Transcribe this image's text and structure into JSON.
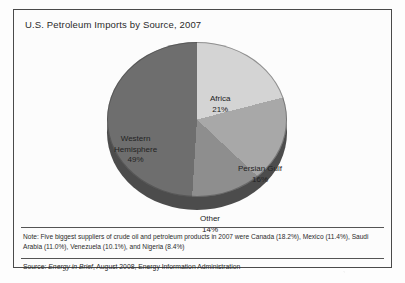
{
  "figure": {
    "title": "U.S. Petroleum Imports by Source, 2007",
    "note": "Note: Five biggest suppliers of crude oil and petroleum products in 2007 were Canada (18.2%), Mexico (11.4%), Saudi Arabia (11.0%), Venezuela (10.1%), and Nigeria (8.4%)",
    "source_prefix": "Source: ",
    "source_publication": "Energy in Brief",
    "source_suffix": ", August 2008, Energy Information Administration"
  },
  "chart_data": {
    "type": "pie",
    "title": "U.S. Petroleum Imports by Source, 2007",
    "xlabel": "",
    "ylabel": "",
    "legend": "none",
    "grid": false,
    "start_angle_deg": 0,
    "direction": "clockwise",
    "categories": [
      "Africa",
      "Persian Gulf",
      "Other",
      "Western Hemisphere"
    ],
    "values": [
      21,
      16,
      14,
      49
    ],
    "unit": "%",
    "colors": [
      "#d4d4d4",
      "#a8a8a8",
      "#8e8e8e",
      "#6e6e6e"
    ],
    "depth_color": "#4c4c4c",
    "slices": [
      {
        "label": "Africa",
        "value": 21,
        "display": "21%",
        "color": "#d4d4d4"
      },
      {
        "label": "Persian Gulf",
        "value": 16,
        "display": "16%",
        "color": "#a8a8a8"
      },
      {
        "label": "Other",
        "value": 14,
        "display": "14%",
        "color": "#8e8e8e"
      },
      {
        "label": "Western Hemisphere",
        "value": 49,
        "display": "49%",
        "color": "#6e6e6e"
      }
    ]
  }
}
